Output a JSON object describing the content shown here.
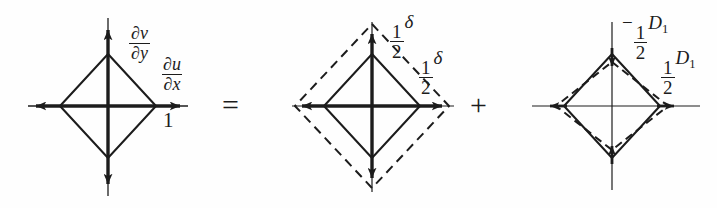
{
  "figure": {
    "width": 717,
    "height": 208,
    "background": "#fefefe",
    "ink": "#1c1c1c"
  },
  "operators": [
    {
      "symbol": "=",
      "name": "equals-sign"
    },
    {
      "symbol": "+",
      "name": "plus-sign"
    }
  ],
  "panels": [
    {
      "id": "panel-total",
      "name": "total-deformation-diagram",
      "caption": "Total deformation of unit element",
      "center": {
        "x": 108,
        "y": 106
      },
      "solid_diamond": {
        "rx": 48,
        "ry": 52,
        "style": "solid"
      },
      "dashed_diamond": null,
      "arrows": [
        {
          "name": "arrow-up",
          "dir": "up",
          "length": 88,
          "heads": 1
        },
        {
          "name": "arrow-down",
          "dir": "down",
          "length": 90,
          "heads": 1
        },
        {
          "name": "arrow-left",
          "dir": "left",
          "length": 80,
          "heads": 1
        },
        {
          "name": "arrow-right",
          "dir": "right",
          "length": 80,
          "heads": 1
        }
      ],
      "labels": [
        {
          "name": "label-dv-dy",
          "kind": "fraction",
          "num": "∂v",
          "den": "∂y",
          "text": "∂v/∂y",
          "x": 128,
          "y": 14
        },
        {
          "name": "label-du-dx",
          "kind": "fraction",
          "num": "∂u",
          "den": "∂x",
          "text": "∂u/∂x",
          "x": 160,
          "y": 45
        },
        {
          "name": "label-one",
          "kind": "plain",
          "text": "1",
          "x": 163,
          "y": 110
        }
      ]
    },
    {
      "id": "panel-dilatation",
      "name": "dilatation-diagram",
      "caption": "Isotropic expansion component",
      "center": {
        "x": 372,
        "y": 106
      },
      "solid_diamond": {
        "rx": 48,
        "ry": 52,
        "style": "solid"
      },
      "dashed_diamond": {
        "rx": 77,
        "ry": 82,
        "style": "dashed"
      },
      "arrows": [
        {
          "name": "arrow-up",
          "dir": "up",
          "length": 82,
          "heads": 1
        },
        {
          "name": "arrow-down",
          "dir": "down",
          "length": 84,
          "heads": 1
        },
        {
          "name": "arrow-left",
          "dir": "left",
          "length": 78,
          "heads": 1
        },
        {
          "name": "arrow-right",
          "dir": "right",
          "length": 78,
          "heads": 1
        }
      ],
      "labels": [
        {
          "name": "label-half-delta-top",
          "kind": "fraction-symbol",
          "num": "1",
          "den": "2",
          "symbol": "δ",
          "text": "½δ",
          "x": 389,
          "y": 11
        },
        {
          "name": "label-half-delta-right",
          "kind": "fraction-symbol",
          "num": "1",
          "den": "2",
          "symbol": "δ",
          "text": "½δ",
          "x": 418,
          "y": 47
        }
      ]
    },
    {
      "id": "panel-deviatoric",
      "name": "deviatoric-strain-diagram",
      "caption": "Pure shear (deviatoric) component",
      "center": {
        "x": 612,
        "y": 106
      },
      "solid_diamond": {
        "rx": 48,
        "ry": 52,
        "style": "solid"
      },
      "dashed_diamond": {
        "rx": 56,
        "ry": 44,
        "style": "dashed"
      },
      "arrows": [
        {
          "name": "arrow-up-inward",
          "dir": "down-inward-top",
          "length": 14,
          "heads": 1
        },
        {
          "name": "arrow-down-inward",
          "dir": "up-inward-bottom",
          "length": 14,
          "heads": 1
        },
        {
          "name": "arrow-left-outward",
          "dir": "left",
          "length": 14,
          "heads": 1
        },
        {
          "name": "arrow-right-outward",
          "dir": "right",
          "length": 14,
          "heads": 1
        }
      ],
      "labels": [
        {
          "name": "label-minus-half-d1",
          "kind": "signed-fraction-var",
          "sign": "−",
          "num": "1",
          "den": "2",
          "var": "D",
          "subscript": "1",
          "text": "−½D₁",
          "x": 622,
          "y": 12
        },
        {
          "name": "label-half-d1",
          "kind": "fraction-var",
          "num": "1",
          "den": "2",
          "var": "D",
          "subscript": "1",
          "text": "½D₁",
          "x": 660,
          "y": 47
        }
      ]
    }
  ]
}
